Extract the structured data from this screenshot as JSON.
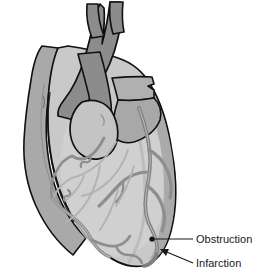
{
  "figure": {
    "name": "heart-coronary-occlusion-diagram",
    "background_color": "#ffffff"
  },
  "palette": {
    "great_vessel_dark": "#8c8c8c",
    "atrium_mid": "#b0b0b0",
    "ventricle_light": "#c9c9c9",
    "ventricle_highlight": "#d4d4d4",
    "vessel_gray": "#8e8e8e",
    "faint_vessel": "#b4b4b4",
    "outline": "#111111",
    "leader_line": "#1a1a1a",
    "label_color": "#1a1a1a"
  },
  "annotations": [
    {
      "id": "obstruction",
      "label": "Obstruction",
      "marker": "dot",
      "anchor_x": 152,
      "anchor_y": 239,
      "label_x": 196,
      "label_y": 241
    },
    {
      "id": "infarction",
      "label": "Infarction",
      "marker": "arrow",
      "anchor_x": 161,
      "anchor_y": 251,
      "label_x": 196,
      "label_y": 265
    }
  ],
  "structures": [
    {
      "id": "aorta",
      "name": "aorta"
    },
    {
      "id": "pulmonary-trunk",
      "name": "pulmonary-trunk"
    },
    {
      "id": "superior-vena-cava",
      "name": "superior-vena-cava"
    },
    {
      "id": "left-atrial-appendage",
      "name": "left-atrial-appendage"
    },
    {
      "id": "right-atrial-appendage",
      "name": "right-atrial-appendage"
    },
    {
      "id": "left-ventricle",
      "name": "left-ventricle"
    },
    {
      "id": "right-ventricle",
      "name": "right-ventricle"
    },
    {
      "id": "right-coronary-artery",
      "name": "right-coronary-artery"
    },
    {
      "id": "left-anterior-descending-artery",
      "name": "left-anterior-descending-artery"
    },
    {
      "id": "marginal-branches",
      "name": "marginal-branches"
    }
  ]
}
